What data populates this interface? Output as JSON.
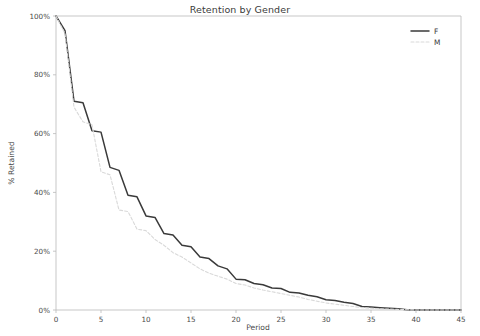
{
  "chart_data": {
    "type": "line",
    "title": "Retention by Gender",
    "xlabel": "Period",
    "ylabel": "% Retained",
    "xlim": [
      0,
      45
    ],
    "ylim": [
      0,
      100
    ],
    "xticks": [
      0,
      5,
      10,
      15,
      20,
      25,
      30,
      35,
      40,
      45
    ],
    "xtick_labels": [
      "0",
      "5",
      "10",
      "15",
      "20",
      "25",
      "30",
      "35",
      "40",
      "45"
    ],
    "yticks": [
      0,
      20,
      40,
      60,
      80,
      100
    ],
    "ytick_labels": [
      "0%",
      "20%",
      "40%",
      "60%",
      "80%",
      "100%"
    ],
    "grid": false,
    "legend_position": "upper right",
    "x": [
      0,
      1,
      2,
      3,
      4,
      5,
      6,
      7,
      8,
      9,
      10,
      11,
      12,
      13,
      14,
      15,
      16,
      17,
      18,
      19,
      20,
      21,
      22,
      23,
      24,
      25,
      26,
      27,
      28,
      29,
      30,
      31,
      32,
      33,
      34,
      35,
      36,
      37,
      38,
      39,
      40,
      41,
      42,
      43,
      44,
      45
    ],
    "series": [
      {
        "name": "F",
        "label": "F",
        "color": "#3a3a3a",
        "linestyle": "solid",
        "linewidth": 1.5,
        "values": [
          100,
          95,
          71,
          70.5,
          61,
          60.5,
          48.5,
          47.5,
          39,
          38.5,
          32,
          31.5,
          26,
          25.5,
          22,
          21.5,
          18,
          17.5,
          15,
          14,
          10.5,
          10.3,
          9,
          8.6,
          7.5,
          7.3,
          6,
          5.8,
          5,
          4.5,
          3.5,
          3.2,
          2.6,
          2.2,
          1.2,
          1.0,
          0.8,
          0.6,
          0.4,
          0.1,
          0,
          0,
          0,
          0,
          0,
          0
        ]
      },
      {
        "name": "M",
        "label": "M",
        "color": "#d9d9d9",
        "linestyle": "dashed",
        "linewidth": 1.1,
        "values": [
          100,
          94,
          69,
          64,
          63,
          47,
          46,
          34,
          33.5,
          27.5,
          27,
          24,
          22,
          19.5,
          18,
          16,
          14,
          12.5,
          11.5,
          10.5,
          9,
          8.5,
          7.5,
          6.8,
          6.2,
          5.6,
          5.0,
          4.4,
          3.6,
          3.0,
          2.4,
          2.0,
          1.6,
          1.2,
          0.8,
          0.6,
          0.4,
          0.3,
          0.2,
          0.1,
          0,
          0,
          0,
          0,
          0,
          0
        ]
      }
    ]
  },
  "legend": {
    "entries": [
      {
        "label": "F"
      },
      {
        "label": "M"
      }
    ]
  }
}
